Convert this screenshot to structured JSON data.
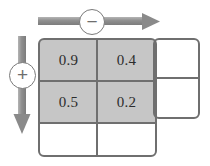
{
  "diagram": {
    "horizontal_axis": {
      "label": "horizontal-axis-arrow",
      "direction": "right",
      "operator": "−",
      "operator_name": "minus"
    },
    "vertical_axis": {
      "label": "vertical-axis-arrow",
      "direction": "down",
      "operator": "+",
      "operator_name": "plus"
    },
    "grid": {
      "columns": 3,
      "rows": 3,
      "cells": [
        [
          {
            "value": "0.9",
            "filled": true
          },
          {
            "value": "0.4",
            "filled": true
          },
          {
            "value": "",
            "filled": false
          }
        ],
        [
          {
            "value": "0.5",
            "filled": true
          },
          {
            "value": "0.2",
            "filled": true
          },
          {
            "value": "",
            "filled": false
          }
        ],
        [
          {
            "value": "",
            "filled": false
          },
          {
            "value": "",
            "filled": false
          },
          {
            "value": "",
            "filled": false
          }
        ]
      ]
    },
    "colors": {
      "fill": "#c6c6c6",
      "stroke": "#6f6f6f",
      "arrow": "#8a8a8a",
      "text": "#2c2c2c",
      "background": "#ffffff"
    }
  }
}
